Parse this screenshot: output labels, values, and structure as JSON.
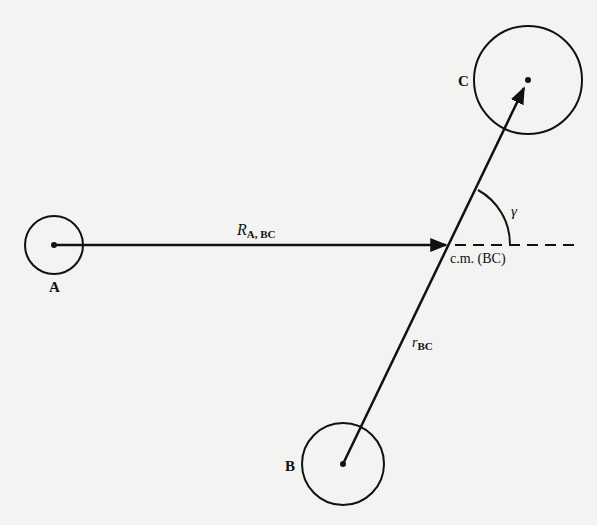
{
  "diagram": {
    "type": "jacobi-coordinates",
    "atoms": [
      {
        "id": "A",
        "label": "A"
      },
      {
        "id": "B",
        "label": "B"
      },
      {
        "id": "C",
        "label": "C"
      }
    ],
    "vectors": {
      "R": {
        "label_main": "R",
        "label_sub": "A, BC"
      },
      "r": {
        "label_main": "r",
        "label_sub": "BC"
      }
    },
    "center_of_mass_label": "c.m. (BC)",
    "angle_label": "γ",
    "colors": {
      "ink": "#111111",
      "paper": "#f3f3f1"
    }
  }
}
